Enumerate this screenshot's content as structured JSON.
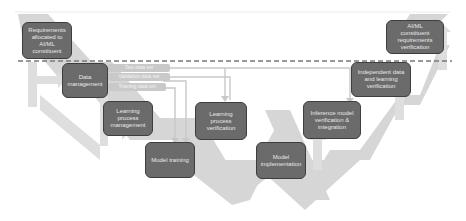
{
  "diagram": {
    "type": "W-shaped development lifecycle (AI/ML learning assurance)",
    "colors": {
      "box_fill": "#6b6b6b",
      "box_border": "#3e3e3e",
      "box_text": "#e8e8e8",
      "arrow_fill": "#d4d4d4",
      "dataset_fill": "#c9c9c9",
      "dashed_line": "#7a7a7a"
    },
    "boxes": {
      "requirements": "Requirements\nallocated to\nAI/ML\nconstituent",
      "data_management": "Data\nmanagement",
      "learning_process_management": "Learning\nprocess\nmanagement",
      "model_training": "Model training",
      "learning_process_verification": "Learning\nprocess\nverification",
      "model_implementation": "Model\nimplementation",
      "inference_model_verification": "Inference model\nverification &\nintegration",
      "independent_data_verification": "Independent data\nand learning\nverification",
      "constituent_requirements_verification": "AI/ML\nconstituent\nrequirements\nverification"
    },
    "datasets": [
      {
        "label": "Test data set"
      },
      {
        "label": "Validation data set"
      },
      {
        "label": "Training data set"
      }
    ]
  }
}
